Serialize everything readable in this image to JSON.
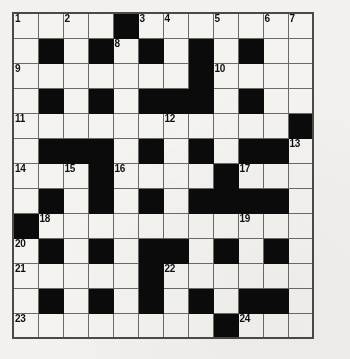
{
  "puzzle": {
    "type": "crossword-grid",
    "title": "Crossword puzzle grid",
    "columns": 12,
    "rows": 13,
    "cell_size_px": 25,
    "colors": {
      "block": "#0b0b0b",
      "open": "#f4f3f0",
      "grid_line": "#6a6a68",
      "page_background": "#f2f1ee",
      "number_text": "#101010"
    },
    "clue_numbers": [
      1,
      2,
      3,
      4,
      5,
      6,
      7,
      8,
      9,
      10,
      11,
      12,
      13,
      14,
      15,
      16,
      17,
      18,
      19,
      20,
      21,
      22,
      23,
      24
    ],
    "grid": [
      [
        {
          "block": false,
          "num": "1",
          "letter": ""
        },
        {
          "block": false,
          "num": "",
          "letter": ""
        },
        {
          "block": false,
          "num": "2",
          "letter": ""
        },
        {
          "block": false,
          "num": "",
          "letter": ""
        },
        {
          "block": true,
          "num": "",
          "letter": ""
        },
        {
          "block": false,
          "num": "3",
          "letter": ""
        },
        {
          "block": false,
          "num": "4",
          "letter": ""
        },
        {
          "block": false,
          "num": "",
          "letter": ""
        },
        {
          "block": false,
          "num": "5",
          "letter": ""
        },
        {
          "block": false,
          "num": "",
          "letter": ""
        },
        {
          "block": false,
          "num": "6",
          "letter": ""
        },
        {
          "block": false,
          "num": "7",
          "letter": ""
        }
      ],
      [
        {
          "block": false,
          "num": "",
          "letter": ""
        },
        {
          "block": true,
          "num": "",
          "letter": ""
        },
        {
          "block": false,
          "num": "",
          "letter": ""
        },
        {
          "block": true,
          "num": "",
          "letter": ""
        },
        {
          "block": false,
          "num": "8",
          "letter": ""
        },
        {
          "block": true,
          "num": "",
          "letter": ""
        },
        {
          "block": false,
          "num": "",
          "letter": ""
        },
        {
          "block": true,
          "num": "",
          "letter": ""
        },
        {
          "block": false,
          "num": "",
          "letter": ""
        },
        {
          "block": true,
          "num": "",
          "letter": ""
        },
        {
          "block": false,
          "num": "",
          "letter": ""
        },
        {
          "block": false,
          "num": "",
          "letter": ""
        }
      ],
      [
        {
          "block": false,
          "num": "9",
          "letter": ""
        },
        {
          "block": false,
          "num": "",
          "letter": ""
        },
        {
          "block": false,
          "num": "",
          "letter": ""
        },
        {
          "block": false,
          "num": "",
          "letter": ""
        },
        {
          "block": false,
          "num": "",
          "letter": ""
        },
        {
          "block": false,
          "num": "",
          "letter": ""
        },
        {
          "block": false,
          "num": "",
          "letter": ""
        },
        {
          "block": true,
          "num": "",
          "letter": ""
        },
        {
          "block": false,
          "num": "10",
          "letter": ""
        },
        {
          "block": false,
          "num": "",
          "letter": ""
        },
        {
          "block": false,
          "num": "",
          "letter": ""
        },
        {
          "block": false,
          "num": "",
          "letter": ""
        }
      ],
      [
        {
          "block": false,
          "num": "",
          "letter": ""
        },
        {
          "block": true,
          "num": "",
          "letter": ""
        },
        {
          "block": false,
          "num": "",
          "letter": ""
        },
        {
          "block": true,
          "num": "",
          "letter": ""
        },
        {
          "block": false,
          "num": "",
          "letter": ""
        },
        {
          "block": true,
          "num": "",
          "letter": ""
        },
        {
          "block": true,
          "num": "",
          "letter": ""
        },
        {
          "block": true,
          "num": "",
          "letter": ""
        },
        {
          "block": false,
          "num": "",
          "letter": ""
        },
        {
          "block": true,
          "num": "",
          "letter": ""
        },
        {
          "block": false,
          "num": "",
          "letter": ""
        },
        {
          "block": false,
          "num": "",
          "letter": ""
        }
      ],
      [
        {
          "block": false,
          "num": "11",
          "letter": ""
        },
        {
          "block": false,
          "num": "",
          "letter": ""
        },
        {
          "block": false,
          "num": "",
          "letter": ""
        },
        {
          "block": false,
          "num": "",
          "letter": ""
        },
        {
          "block": false,
          "num": "",
          "letter": ""
        },
        {
          "block": false,
          "num": "",
          "letter": ""
        },
        {
          "block": false,
          "num": "12",
          "letter": ""
        },
        {
          "block": false,
          "num": "",
          "letter": ""
        },
        {
          "block": false,
          "num": "",
          "letter": ""
        },
        {
          "block": false,
          "num": "",
          "letter": ""
        },
        {
          "block": false,
          "num": "",
          "letter": ""
        },
        {
          "block": true,
          "num": "",
          "letter": ""
        }
      ],
      [
        {
          "block": false,
          "num": "",
          "letter": ""
        },
        {
          "block": true,
          "num": "",
          "letter": ""
        },
        {
          "block": true,
          "num": "",
          "letter": ""
        },
        {
          "block": true,
          "num": "",
          "letter": ""
        },
        {
          "block": false,
          "num": "",
          "letter": ""
        },
        {
          "block": true,
          "num": "",
          "letter": ""
        },
        {
          "block": false,
          "num": "",
          "letter": ""
        },
        {
          "block": true,
          "num": "",
          "letter": ""
        },
        {
          "block": false,
          "num": "",
          "letter": ""
        },
        {
          "block": true,
          "num": "",
          "letter": ""
        },
        {
          "block": true,
          "num": "",
          "letter": ""
        },
        {
          "block": false,
          "num": "13",
          "letter": ""
        }
      ],
      [
        {
          "block": false,
          "num": "14",
          "letter": ""
        },
        {
          "block": false,
          "num": "",
          "letter": ""
        },
        {
          "block": false,
          "num": "15",
          "letter": ""
        },
        {
          "block": true,
          "num": "",
          "letter": ""
        },
        {
          "block": false,
          "num": "16",
          "letter": ""
        },
        {
          "block": false,
          "num": "",
          "letter": ""
        },
        {
          "block": false,
          "num": "",
          "letter": ""
        },
        {
          "block": false,
          "num": "",
          "letter": ""
        },
        {
          "block": true,
          "num": "",
          "letter": ""
        },
        {
          "block": false,
          "num": "17",
          "letter": ""
        },
        {
          "block": false,
          "num": "",
          "letter": ""
        },
        {
          "block": false,
          "num": "",
          "letter": ""
        }
      ],
      [
        {
          "block": false,
          "num": "",
          "letter": ""
        },
        {
          "block": true,
          "num": "",
          "letter": ""
        },
        {
          "block": false,
          "num": "",
          "letter": ""
        },
        {
          "block": true,
          "num": "",
          "letter": ""
        },
        {
          "block": false,
          "num": "",
          "letter": ""
        },
        {
          "block": true,
          "num": "",
          "letter": ""
        },
        {
          "block": false,
          "num": "",
          "letter": ""
        },
        {
          "block": true,
          "num": "",
          "letter": ""
        },
        {
          "block": true,
          "num": "",
          "letter": ""
        },
        {
          "block": true,
          "num": "",
          "letter": ""
        },
        {
          "block": true,
          "num": "",
          "letter": ""
        },
        {
          "block": false,
          "num": "",
          "letter": ""
        }
      ],
      [
        {
          "block": true,
          "num": "",
          "letter": ""
        },
        {
          "block": false,
          "num": "18",
          "letter": ""
        },
        {
          "block": false,
          "num": "",
          "letter": ""
        },
        {
          "block": false,
          "num": "",
          "letter": ""
        },
        {
          "block": false,
          "num": "",
          "letter": ""
        },
        {
          "block": false,
          "num": "",
          "letter": ""
        },
        {
          "block": false,
          "num": "",
          "letter": ""
        },
        {
          "block": false,
          "num": "",
          "letter": ""
        },
        {
          "block": false,
          "num": "",
          "letter": ""
        },
        {
          "block": false,
          "num": "19",
          "letter": ""
        },
        {
          "block": false,
          "num": "",
          "letter": ""
        },
        {
          "block": false,
          "num": "",
          "letter": ""
        }
      ],
      [
        {
          "block": false,
          "num": "20",
          "letter": ""
        },
        {
          "block": true,
          "num": "",
          "letter": ""
        },
        {
          "block": false,
          "num": "",
          "letter": ""
        },
        {
          "block": true,
          "num": "",
          "letter": ""
        },
        {
          "block": false,
          "num": "",
          "letter": ""
        },
        {
          "block": true,
          "num": "",
          "letter": ""
        },
        {
          "block": true,
          "num": "",
          "letter": ""
        },
        {
          "block": false,
          "num": "",
          "letter": ""
        },
        {
          "block": true,
          "num": "",
          "letter": ""
        },
        {
          "block": false,
          "num": "",
          "letter": ""
        },
        {
          "block": true,
          "num": "",
          "letter": ""
        },
        {
          "block": false,
          "num": "",
          "letter": ""
        }
      ],
      [
        {
          "block": false,
          "num": "21",
          "letter": ""
        },
        {
          "block": false,
          "num": "",
          "letter": ""
        },
        {
          "block": false,
          "num": "",
          "letter": ""
        },
        {
          "block": false,
          "num": "",
          "letter": ""
        },
        {
          "block": false,
          "num": "",
          "letter": ""
        },
        {
          "block": true,
          "num": "",
          "letter": ""
        },
        {
          "block": false,
          "num": "22",
          "letter": ""
        },
        {
          "block": false,
          "num": "",
          "letter": ""
        },
        {
          "block": false,
          "num": "",
          "letter": ""
        },
        {
          "block": false,
          "num": "",
          "letter": ""
        },
        {
          "block": false,
          "num": "",
          "letter": ""
        },
        {
          "block": false,
          "num": "",
          "letter": ""
        }
      ],
      [
        {
          "block": false,
          "num": "",
          "letter": ""
        },
        {
          "block": true,
          "num": "",
          "letter": ""
        },
        {
          "block": false,
          "num": "",
          "letter": ""
        },
        {
          "block": true,
          "num": "",
          "letter": ""
        },
        {
          "block": false,
          "num": "",
          "letter": ""
        },
        {
          "block": true,
          "num": "",
          "letter": ""
        },
        {
          "block": false,
          "num": "",
          "letter": ""
        },
        {
          "block": true,
          "num": "",
          "letter": ""
        },
        {
          "block": false,
          "num": "",
          "letter": ""
        },
        {
          "block": true,
          "num": "",
          "letter": ""
        },
        {
          "block": true,
          "num": "",
          "letter": ""
        },
        {
          "block": false,
          "num": "",
          "letter": ""
        }
      ],
      [
        {
          "block": false,
          "num": "23",
          "letter": ""
        },
        {
          "block": false,
          "num": "",
          "letter": ""
        },
        {
          "block": false,
          "num": "",
          "letter": ""
        },
        {
          "block": false,
          "num": "",
          "letter": ""
        },
        {
          "block": false,
          "num": "",
          "letter": ""
        },
        {
          "block": false,
          "num": "",
          "letter": ""
        },
        {
          "block": false,
          "num": "",
          "letter": ""
        },
        {
          "block": false,
          "num": "",
          "letter": ""
        },
        {
          "block": true,
          "num": "",
          "letter": ""
        },
        {
          "block": false,
          "num": "24",
          "letter": ""
        },
        {
          "block": false,
          "num": "",
          "letter": ""
        },
        {
          "block": false,
          "num": "",
          "letter": ""
        }
      ]
    ]
  }
}
